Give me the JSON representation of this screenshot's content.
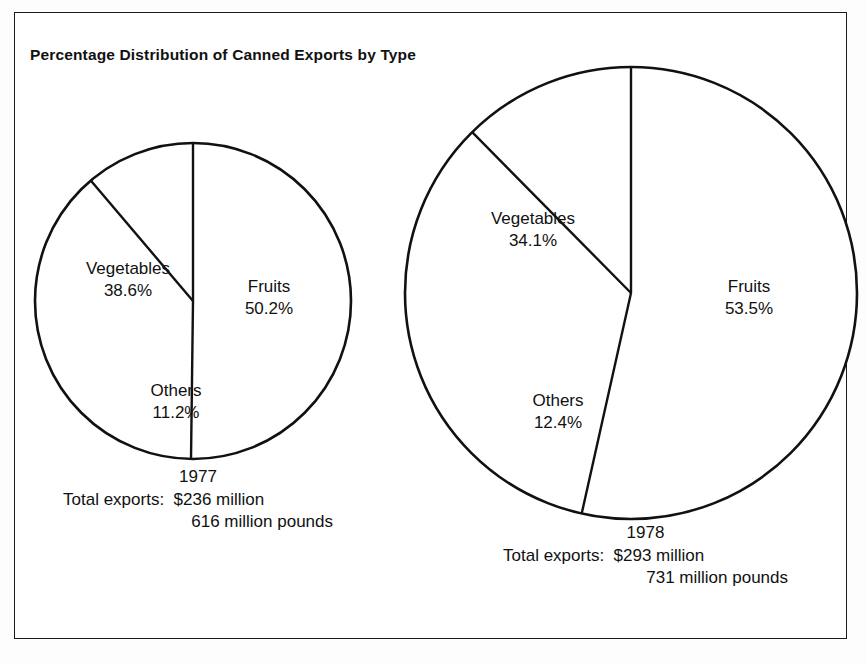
{
  "figure": {
    "title": "Percentage Distribution of Canned Exports by Type",
    "frame_color": "#1a1a1a",
    "background": "#ffffff"
  },
  "chart_data": {
    "type": "pie",
    "title": "Percentage Distribution of Canned Exports by Type",
    "xlabel": "",
    "ylabel": "",
    "legend": "none",
    "grid": false,
    "categories": [
      "Fruits",
      "Vegetables",
      "Others"
    ],
    "units": "percent",
    "charts": [
      {
        "name": "1977",
        "year": "1977",
        "labels": [
          "Fruits",
          "Vegetables",
          "Others"
        ],
        "values": [
          50.2,
          38.6,
          11.2
        ],
        "value_labels": [
          "50.2%",
          "38.6%",
          "11.2%"
        ],
        "total_exports_dollars": "$236 million",
        "total_exports_pounds": "616 million pounds"
      },
      {
        "name": "1978",
        "year": "1978",
        "labels": [
          "Fruits",
          "Vegetables",
          "Others"
        ],
        "values": [
          53.5,
          34.1,
          12.4
        ],
        "value_labels": [
          "53.5%",
          "34.1%",
          "12.4%"
        ],
        "total_exports_dollars": "$293 million",
        "total_exports_pounds": "731 million pounds"
      }
    ]
  },
  "pie_1977": {
    "fruits": {
      "name": "Fruits",
      "pct": "50.2%"
    },
    "vegetables": {
      "name": "Vegetables",
      "pct": "38.6%"
    },
    "others": {
      "name": "Others",
      "pct": "11.2%"
    },
    "caption": {
      "year": "1977",
      "line1": "Total exports:  $236 million",
      "line2": "616 million pounds"
    }
  },
  "pie_1978": {
    "fruits": {
      "name": "Fruits",
      "pct": "53.5%"
    },
    "vegetables": {
      "name": "Vegetables",
      "pct": "34.1%"
    },
    "others": {
      "name": "Others",
      "pct": "12.4%"
    },
    "caption": {
      "year": "1978",
      "line1": "Total exports:  $293 million",
      "line2": "731 million pounds"
    }
  }
}
